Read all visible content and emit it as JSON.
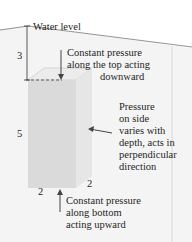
{
  "figure": {
    "water_level_label": "Water level",
    "depth_to_top": "3",
    "height": "5",
    "width_front": "2",
    "width_side": "2",
    "top_annotation": [
      "Constant pressure",
      "along the top acting",
      "downward"
    ],
    "side_annotation": [
      "Pressure",
      "on side",
      "varies with",
      "depth, acts in",
      "perpendicular",
      "direction"
    ],
    "bottom_annotation": [
      "Constant pressure",
      "along bottom",
      "acting upward"
    ]
  },
  "colors": {
    "water_fill": "#f2f2f2",
    "box_front": "#dcdcdc",
    "box_side": "#e8e8e8",
    "box_top": "#ededed",
    "line": "#444444"
  }
}
